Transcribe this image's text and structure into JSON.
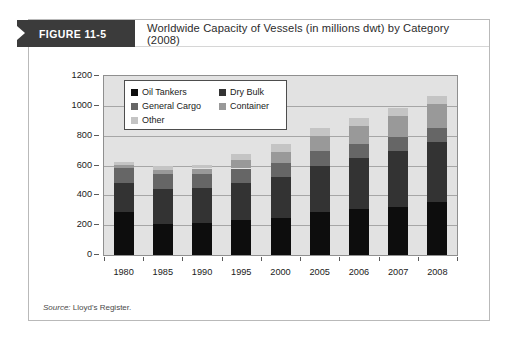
{
  "figure": {
    "tag": "FIGURE 11-5",
    "title": "Worldwide Capacity of Vessels (in millions dwt) by Category (2008)",
    "source_prefix": "Source:",
    "source_text": "Lloyd's Register."
  },
  "chart_data": {
    "type": "bar",
    "subtype": "stacked-bar",
    "title": "Worldwide Capacity of Vessels (in millions dwt) by Category (2008)",
    "xlabel": "",
    "ylabel": "",
    "ylim": [
      0,
      1200
    ],
    "yticks": [
      0,
      200,
      400,
      600,
      800,
      1000,
      1200
    ],
    "grid": true,
    "legend_position": "inside-top-left",
    "categories": [
      "1980",
      "1985",
      "1990",
      "1995",
      "2000",
      "2005",
      "2006",
      "2007",
      "2008"
    ],
    "series": [
      {
        "name": "Oil Tankers",
        "color": "#0d0d0d",
        "values": [
          290,
          210,
          215,
          235,
          245,
          290,
          310,
          325,
          355
        ]
      },
      {
        "name": "Dry Bulk",
        "color": "#333333",
        "values": [
          190,
          230,
          235,
          250,
          275,
          310,
          340,
          370,
          400
        ]
      },
      {
        "name": "General Cargo",
        "color": "#666666",
        "values": [
          105,
          100,
          95,
          95,
          95,
          95,
          95,
          95,
          95
        ]
      },
      {
        "name": "Container",
        "color": "#999999",
        "values": [
          20,
          30,
          35,
          55,
          75,
          100,
          120,
          140,
          160
        ]
      },
      {
        "name": "Other",
        "color": "#c4c4c4",
        "values": [
          20,
          30,
          25,
          45,
          55,
          55,
          55,
          55,
          55
        ]
      }
    ],
    "totals": [
      625,
      600,
      605,
      680,
      745,
      850,
      920,
      985,
      1065
    ]
  },
  "legend": {
    "items": [
      {
        "label": "Oil Tankers",
        "color": "#0d0d0d"
      },
      {
        "label": "Dry Bulk",
        "color": "#333333"
      },
      {
        "label": "General Cargo",
        "color": "#666666"
      },
      {
        "label": "Container",
        "color": "#999999"
      },
      {
        "label": "Other",
        "color": "#c4c4c4"
      }
    ]
  },
  "colors": {
    "tag_background": "#3b3b3b",
    "plot_background": "#e2e2e2",
    "gridline": "#a6a6a6",
    "frame_border": "#b9b9b9"
  }
}
